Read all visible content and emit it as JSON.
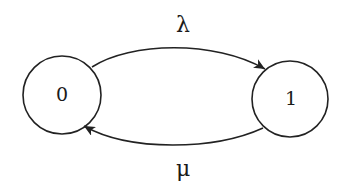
{
  "diagram": {
    "type": "state-transition",
    "stroke_color": "#222222",
    "states": [
      {
        "id": "state-0",
        "label": "0",
        "cx": 62,
        "cy": 95,
        "r": 39
      },
      {
        "id": "state-1",
        "label": "1",
        "cx": 290,
        "cy": 99,
        "r": 38
      }
    ],
    "transitions": [
      {
        "from": "0",
        "to": "1",
        "label": "λ",
        "direction": "forward-top"
      },
      {
        "from": "1",
        "to": "0",
        "label": "μ",
        "direction": "backward-bottom"
      }
    ]
  }
}
